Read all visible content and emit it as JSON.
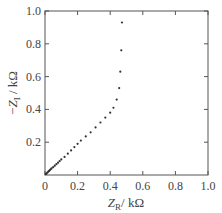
{
  "chart_data": {
    "type": "scatter",
    "title": "",
    "xlabel": "Z_R / kΩ",
    "ylabel": "−Z_I / kΩ",
    "xlim": [
      0,
      1.0
    ],
    "ylim": [
      0,
      1.0
    ],
    "x_ticks": [
      "0",
      "0.2",
      "0.4",
      "0.6",
      "0.8",
      "1.0"
    ],
    "y_ticks": [
      "0.2",
      "0.4",
      "0.6",
      "0.8",
      "1.0"
    ],
    "grid": false,
    "legend": null,
    "series": [
      {
        "name": "impedance",
        "points": [
          [
            0.005,
            0.005
          ],
          [
            0.01,
            0.01
          ],
          [
            0.015,
            0.015
          ],
          [
            0.02,
            0.02
          ],
          [
            0.025,
            0.025
          ],
          [
            0.03,
            0.03
          ],
          [
            0.035,
            0.035
          ],
          [
            0.04,
            0.04
          ],
          [
            0.05,
            0.048
          ],
          [
            0.06,
            0.057
          ],
          [
            0.07,
            0.066
          ],
          [
            0.08,
            0.075
          ],
          [
            0.09,
            0.085
          ],
          [
            0.1,
            0.095
          ],
          [
            0.12,
            0.11
          ],
          [
            0.14,
            0.13
          ],
          [
            0.16,
            0.15
          ],
          [
            0.18,
            0.17
          ],
          [
            0.2,
            0.19
          ],
          [
            0.22,
            0.21
          ],
          [
            0.25,
            0.235
          ],
          [
            0.28,
            0.26
          ],
          [
            0.31,
            0.29
          ],
          [
            0.34,
            0.32
          ],
          [
            0.37,
            0.35
          ],
          [
            0.4,
            0.38
          ],
          [
            0.42,
            0.41
          ],
          [
            0.44,
            0.46
          ],
          [
            0.455,
            0.53
          ],
          [
            0.462,
            0.63
          ],
          [
            0.468,
            0.76
          ],
          [
            0.472,
            0.93
          ]
        ]
      }
    ]
  }
}
